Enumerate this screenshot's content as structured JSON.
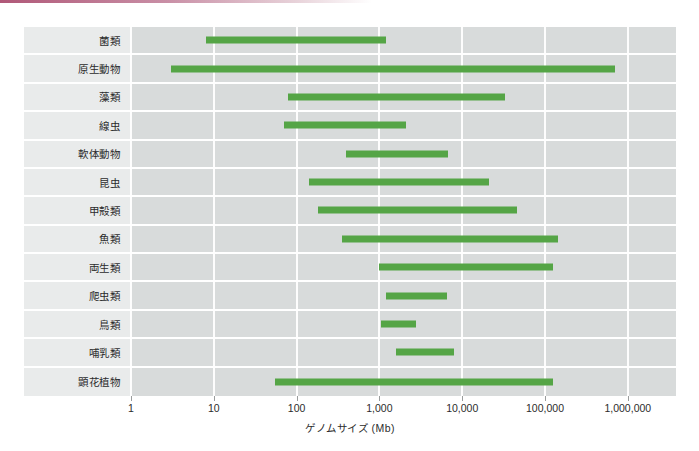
{
  "chart_data": {
    "type": "bar",
    "subtype": "horizontal-range",
    "title": "",
    "xlabel": "ゲノムサイズ (Mb)",
    "ylabel": "",
    "xscale": "log",
    "xlim": [
      1,
      2500000
    ],
    "xticks": [
      1,
      10,
      100,
      1000,
      10000,
      100000,
      1000000
    ],
    "xticklabels": [
      "1",
      "10",
      "100",
      "1,000",
      "10,000",
      "100,000",
      "1,000,000"
    ],
    "grid": true,
    "legend": "none",
    "bar_color": "#55a546",
    "plot_background": "#d8dbdb",
    "label_background": "#e9ebeb",
    "categories": [
      "菌類",
      "原生動物",
      "藻類",
      "線虫",
      "軟体動物",
      "昆虫",
      "甲殻類",
      "魚類",
      "両生類",
      "爬虫類",
      "鳥類",
      "哺乳類",
      "顕花植物"
    ],
    "ranges": [
      {
        "name": "菌類",
        "min": 8,
        "max": 1200
      },
      {
        "name": "原生動物",
        "min": 3,
        "max": 700000
      },
      {
        "name": "藻類",
        "min": 78,
        "max": 33000
      },
      {
        "name": "線虫",
        "min": 70,
        "max": 2100
      },
      {
        "name": "軟体動物",
        "min": 390,
        "max": 6700
      },
      {
        "name": "昆虫",
        "min": 140,
        "max": 21000
      },
      {
        "name": "甲殻類",
        "min": 180,
        "max": 46000
      },
      {
        "name": "魚類",
        "min": 350,
        "max": 145000
      },
      {
        "name": "両生類",
        "min": 1000,
        "max": 125000
      },
      {
        "name": "爬虫類",
        "min": 1200,
        "max": 6500
      },
      {
        "name": "鳥類",
        "min": 1050,
        "max": 2800
      },
      {
        "name": "哺乳類",
        "min": 1600,
        "max": 8000
      },
      {
        "name": "顕花植物",
        "min": 55,
        "max": 125000
      }
    ]
  },
  "accent": {
    "top_bar_color": "#b05878"
  }
}
